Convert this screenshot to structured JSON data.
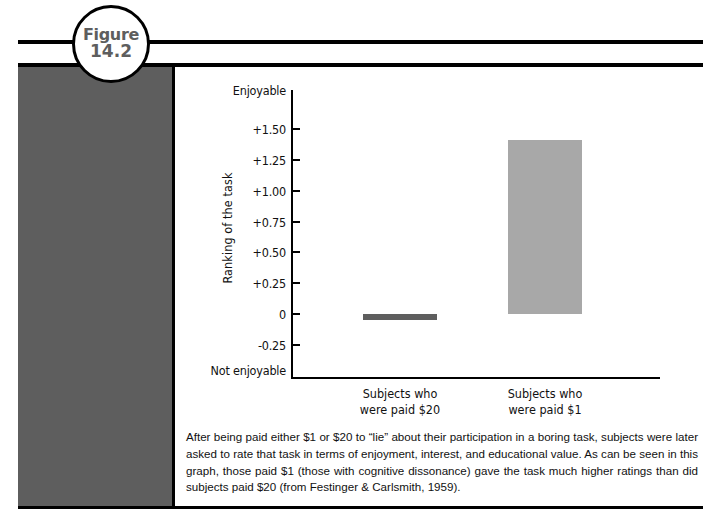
{
  "figure": {
    "badge_word": "Figure",
    "badge_number": "14.2"
  },
  "caption": {
    "text": "After being paid either $1 or $20 to “lie” about their participation in a boring task, subjects were later asked to rate that task in terms of enjoyment, interest, and educational value. As can be seen in this graph, those paid $1 (those with cognitive dissonance) gave the task much higher ratings than did subjects paid $20 (from Festinger & Carlsmith, 1959)."
  },
  "colors": {
    "bar_dark": "#5e5e5e",
    "bar_light": "#a8a8a8",
    "panel": "#5e5e5e",
    "rule": "#000000",
    "text": "#111111"
  },
  "chart_data": {
    "type": "bar",
    "title": "",
    "xlabel": "",
    "ylabel": "Ranking of the task",
    "categories": [
      "Subjects who\nwere paid $20",
      "Subjects who\nwere paid $1"
    ],
    "category_lines": [
      [
        "Subjects who",
        "were paid $20"
      ],
      [
        "Subjects who",
        "were paid $1"
      ]
    ],
    "values": [
      -0.05,
      1.41
    ],
    "series": [
      {
        "name": "Ranking of the task",
        "values": [
          -0.05,
          1.41
        ],
        "colors": [
          "#5e5e5e",
          "#a8a8a8"
        ]
      }
    ],
    "ylim": [
      -0.25,
      1.5
    ],
    "yticks": [
      1.5,
      1.25,
      1.0,
      0.75,
      0.5,
      0.25,
      0,
      -0.25
    ],
    "ytick_labels": [
      "+1.50",
      "+1.25",
      "+1.00",
      "+0.75",
      "+0.50",
      "+0.25",
      "0",
      "-0.25"
    ],
    "axis_endcap_top": "Enjoyable",
    "axis_endcap_bottom": "Not enjoyable",
    "grid": false,
    "legend": false
  }
}
